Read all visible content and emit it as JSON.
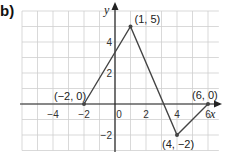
{
  "label": "b)",
  "chart_data": {
    "type": "line",
    "title": "",
    "xlabel": "x",
    "ylabel": "y",
    "x": [
      -2,
      1,
      4,
      6
    ],
    "y": [
      0,
      5,
      -2,
      0
    ],
    "point_labels": [
      "(-2, 0)",
      "(1, 5)",
      "(4, -2)",
      "(6, 0)"
    ],
    "x_ticks": [
      "-4",
      "-2",
      "0",
      "2",
      "4",
      "6"
    ],
    "y_ticks": [
      "4",
      "2",
      "-2"
    ],
    "xlim": [
      -7,
      7
    ],
    "ylim": [
      -3,
      6
    ],
    "grid": true
  }
}
